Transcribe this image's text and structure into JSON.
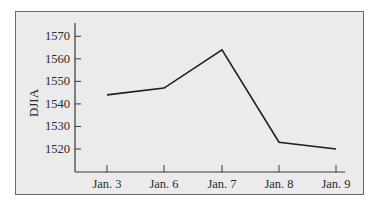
{
  "chart_data": {
    "type": "line",
    "title": "",
    "xlabel": "",
    "ylabel": "DJIA",
    "categories": [
      "Jan. 3",
      "Jan. 6",
      "Jan. 7",
      "Jan. 8",
      "Jan. 9"
    ],
    "values": [
      1544,
      1547,
      1564,
      1523,
      1520
    ],
    "yticks": [
      1520,
      1530,
      1540,
      1550,
      1560,
      1570
    ],
    "ylim": [
      1511,
      1577
    ],
    "grid": false,
    "legend": null,
    "colors": {
      "line": "#1e1e1e",
      "background": "#ebebeb",
      "axis": "#3a3a3a",
      "border": "#6a6a6a"
    }
  }
}
